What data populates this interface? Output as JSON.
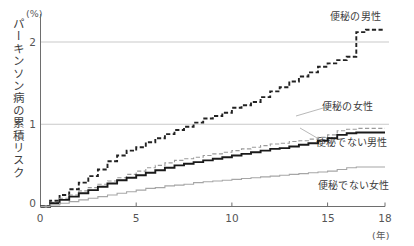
{
  "chart_data": {
    "type": "line",
    "title": "",
    "xlabel": "年",
    "ylabel": "パーキンソン病の累積リスク",
    "yunit": "(%)",
    "xunit": "(年)",
    "xlim": [
      0,
      18
    ],
    "ylim": [
      0,
      2.35
    ],
    "xticks": [
      0,
      5,
      10,
      15,
      18
    ],
    "xtick_labels": [
      "0",
      "5",
      "10",
      "15",
      "18"
    ],
    "yticks": [
      0,
      1,
      2
    ],
    "ytick_labels": [
      "0",
      "1",
      "2"
    ],
    "grid": "horizontal",
    "legend_position": "inline-annotations",
    "series": [
      {
        "name": "便秘の男性",
        "style": "dashed",
        "color": "#222222",
        "width": 1.9,
        "final_value": 2.15,
        "x": [
          0,
          0.5,
          1,
          1.5,
          2,
          2.5,
          3,
          3.5,
          4,
          4.5,
          5,
          5.5,
          6,
          6.5,
          7,
          7.5,
          8,
          8.5,
          9,
          9.5,
          10,
          10.5,
          11,
          11.5,
          12,
          12.5,
          13,
          13.5,
          14,
          14.5,
          15,
          15.5,
          16,
          16.5,
          17,
          17.5,
          18
        ],
        "values": [
          0,
          0.07,
          0.14,
          0.21,
          0.29,
          0.37,
          0.45,
          0.55,
          0.62,
          0.68,
          0.72,
          0.78,
          0.83,
          0.88,
          0.93,
          0.97,
          1.02,
          1.07,
          1.1,
          1.14,
          1.2,
          1.23,
          1.27,
          1.33,
          1.4,
          1.45,
          1.52,
          1.58,
          1.63,
          1.7,
          1.74,
          1.78,
          1.82,
          2.12,
          2.15,
          2.15,
          2.15
        ]
      },
      {
        "name": "便秘の女性",
        "style": "dashed",
        "color": "#9a9a9a",
        "width": 1.1,
        "final_value": 0.95,
        "x": [
          0,
          0.5,
          1,
          1.5,
          2,
          2.5,
          3,
          3.5,
          4,
          4.5,
          5,
          5.5,
          6,
          6.5,
          7,
          7.5,
          8,
          8.5,
          9,
          9.5,
          10,
          10.5,
          11,
          11.5,
          12,
          12.5,
          13,
          13.5,
          14,
          14.5,
          15,
          15.5,
          16,
          16.5,
          17,
          17.5,
          18
        ],
        "values": [
          0,
          0.05,
          0.1,
          0.14,
          0.19,
          0.23,
          0.27,
          0.31,
          0.35,
          0.39,
          0.43,
          0.47,
          0.5,
          0.53,
          0.56,
          0.58,
          0.6,
          0.62,
          0.64,
          0.66,
          0.68,
          0.7,
          0.72,
          0.74,
          0.76,
          0.77,
          0.79,
          0.8,
          0.82,
          0.84,
          0.87,
          0.92,
          0.94,
          0.95,
          0.95,
          0.95,
          0.95
        ]
      },
      {
        "name": "便秘でない男性",
        "style": "solid",
        "color": "#1a1a1a",
        "width": 1.9,
        "final_value": 0.9,
        "x": [
          0,
          0.5,
          1,
          1.5,
          2,
          2.5,
          3,
          3.5,
          4,
          4.5,
          5,
          5.5,
          6,
          6.5,
          7,
          7.5,
          8,
          8.5,
          9,
          9.5,
          10,
          10.5,
          11,
          11.5,
          12,
          12.5,
          13,
          13.5,
          14,
          14.5,
          15,
          15.5,
          16,
          16.5,
          17,
          17.5,
          18
        ],
        "values": [
          0,
          0.04,
          0.08,
          0.12,
          0.16,
          0.2,
          0.24,
          0.28,
          0.32,
          0.35,
          0.38,
          0.41,
          0.44,
          0.47,
          0.5,
          0.52,
          0.54,
          0.56,
          0.58,
          0.6,
          0.62,
          0.64,
          0.66,
          0.68,
          0.7,
          0.71,
          0.73,
          0.75,
          0.77,
          0.8,
          0.83,
          0.87,
          0.89,
          0.9,
          0.9,
          0.9,
          0.9
        ]
      },
      {
        "name": "便秘でない女性",
        "style": "solid",
        "color": "#a6a6a6",
        "width": 1.1,
        "final_value": 0.48,
        "x": [
          0,
          0.5,
          1,
          1.5,
          2,
          2.5,
          3,
          3.5,
          4,
          4.5,
          5,
          5.5,
          6,
          6.5,
          7,
          7.5,
          8,
          8.5,
          9,
          9.5,
          10,
          10.5,
          11,
          11.5,
          12,
          12.5,
          13,
          13.5,
          14,
          14.5,
          15,
          15.5,
          16,
          16.5,
          17,
          17.5,
          18
        ],
        "values": [
          0,
          0.02,
          0.04,
          0.06,
          0.08,
          0.1,
          0.12,
          0.14,
          0.16,
          0.18,
          0.2,
          0.22,
          0.23,
          0.25,
          0.26,
          0.27,
          0.29,
          0.3,
          0.31,
          0.32,
          0.33,
          0.34,
          0.35,
          0.36,
          0.37,
          0.38,
          0.39,
          0.4,
          0.41,
          0.42,
          0.43,
          0.45,
          0.47,
          0.48,
          0.48,
          0.48,
          0.48
        ]
      }
    ],
    "annotations": [
      {
        "name": "便秘の男性",
        "x_px": 330,
        "y_px": 14,
        "leader": false
      },
      {
        "name": "便秘の女性",
        "x_px": 322,
        "y_px": 104,
        "leader": true
      },
      {
        "name": "便秘でない男性",
        "x_px": 316,
        "y_px": 140,
        "leader": true
      },
      {
        "name": "便秘でない女性",
        "x_px": 318,
        "y_px": 183,
        "leader": false
      }
    ]
  },
  "axis": {
    "y_unit": "(%)",
    "y_title": "パーキンソン病の累積リスク",
    "x_unit": "(年)",
    "yticks": [
      "2",
      "1",
      "0"
    ],
    "xticks": [
      "0",
      "5",
      "10",
      "15",
      "18"
    ]
  },
  "colors": {
    "axis": "#6e6e6e",
    "grid": "#c9c9c9",
    "text": "#3c3c3c",
    "men_constipation": "#222222",
    "women_constipation": "#9a9a9a",
    "men_no_constipation": "#1a1a1a",
    "women_no_constipation": "#a6a6a6"
  }
}
